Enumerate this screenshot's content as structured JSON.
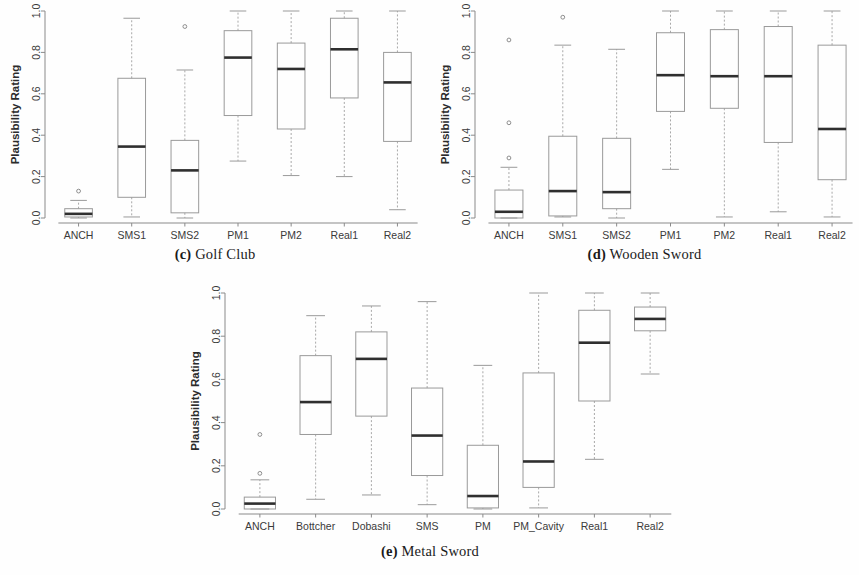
{
  "figure": {
    "y_axis_label": "Plausibility Rating",
    "y_ticks": [
      "0.0",
      "0.2",
      "0.4",
      "0.6",
      "0.8",
      "1.0"
    ]
  },
  "panels": [
    {
      "id": "golf-club",
      "caption_marker": "(c)",
      "caption_text": "Golf Club",
      "caption_full": "(c) Golf Club"
    },
    {
      "id": "wooden-sword",
      "caption_marker": "(d)",
      "caption_text": "Wooden Sword",
      "caption_full": "(d) Wooden Sword"
    },
    {
      "id": "metal-sword",
      "caption_marker": "(e)",
      "caption_text": "Metal Sword",
      "caption_full": "(e) Metal Sword"
    }
  ],
  "chart_data": [
    {
      "type": "box",
      "id": "golf-club",
      "title": "(c) Golf Club",
      "xlabel": "",
      "ylabel": "Plausibility Rating",
      "ylim": [
        0.0,
        1.0
      ],
      "yticks": [
        0.0,
        0.2,
        0.4,
        0.6,
        0.8,
        1.0
      ],
      "grid": false,
      "legend": "none",
      "categories": [
        "ANCH",
        "SMS1",
        "SMS2",
        "PM1",
        "PM2",
        "Real1",
        "Real2"
      ],
      "boxes": [
        {
          "label": "ANCH",
          "whisker_low": 0.0,
          "q1": 0.005,
          "median": 0.02,
          "q3": 0.045,
          "whisker_high": 0.085,
          "outliers": [
            0.13
          ]
        },
        {
          "label": "SMS1",
          "whisker_low": 0.005,
          "q1": 0.1,
          "median": 0.345,
          "q3": 0.675,
          "whisker_high": 0.965,
          "outliers": []
        },
        {
          "label": "SMS2",
          "whisker_low": 0.0,
          "q1": 0.025,
          "median": 0.23,
          "q3": 0.375,
          "whisker_high": 0.715,
          "outliers": [
            0.925
          ]
        },
        {
          "label": "PM1",
          "whisker_low": 0.275,
          "q1": 0.495,
          "median": 0.775,
          "q3": 0.905,
          "whisker_high": 1.0,
          "outliers": []
        },
        {
          "label": "PM2",
          "whisker_low": 0.205,
          "q1": 0.43,
          "median": 0.72,
          "q3": 0.845,
          "whisker_high": 1.0,
          "outliers": []
        },
        {
          "label": "Real1",
          "whisker_low": 0.2,
          "q1": 0.58,
          "median": 0.815,
          "q3": 0.965,
          "whisker_high": 1.0,
          "outliers": []
        },
        {
          "label": "Real2",
          "whisker_low": 0.04,
          "q1": 0.37,
          "median": 0.655,
          "q3": 0.8,
          "whisker_high": 1.0,
          "outliers": []
        }
      ]
    },
    {
      "type": "box",
      "id": "wooden-sword",
      "title": "(d) Wooden Sword",
      "xlabel": "",
      "ylabel": "Plausibility Rating",
      "ylim": [
        0.0,
        1.0
      ],
      "yticks": [
        0.0,
        0.2,
        0.4,
        0.6,
        0.8,
        1.0
      ],
      "grid": false,
      "legend": "none",
      "categories": [
        "ANCH",
        "SMS1",
        "SMS2",
        "PM1",
        "PM2",
        "Real1",
        "Real2"
      ],
      "boxes": [
        {
          "label": "ANCH",
          "whisker_low": 0.0,
          "q1": 0.0,
          "median": 0.03,
          "q3": 0.135,
          "whisker_high": 0.245,
          "outliers": [
            0.29,
            0.46,
            0.86
          ]
        },
        {
          "label": "SMS1",
          "whisker_low": 0.005,
          "q1": 0.01,
          "median": 0.13,
          "q3": 0.395,
          "whisker_high": 0.835,
          "outliers": [
            0.97
          ]
        },
        {
          "label": "SMS2",
          "whisker_low": 0.0,
          "q1": 0.045,
          "median": 0.125,
          "q3": 0.385,
          "whisker_high": 0.815,
          "outliers": []
        },
        {
          "label": "PM1",
          "whisker_low": 0.235,
          "q1": 0.515,
          "median": 0.69,
          "q3": 0.895,
          "whisker_high": 1.0,
          "outliers": []
        },
        {
          "label": "PM2",
          "whisker_low": 0.005,
          "q1": 0.53,
          "median": 0.685,
          "q3": 0.91,
          "whisker_high": 1.0,
          "outliers": []
        },
        {
          "label": "Real1",
          "whisker_low": 0.03,
          "q1": 0.365,
          "median": 0.685,
          "q3": 0.925,
          "whisker_high": 1.0,
          "outliers": []
        },
        {
          "label": "Real2",
          "whisker_low": 0.005,
          "q1": 0.185,
          "median": 0.43,
          "q3": 0.835,
          "whisker_high": 1.0,
          "outliers": []
        }
      ]
    },
    {
      "type": "box",
      "id": "metal-sword",
      "title": "(e) Metal Sword",
      "xlabel": "",
      "ylabel": "Plausibility Rating",
      "ylim": [
        0.0,
        1.0
      ],
      "yticks": [
        0.0,
        0.2,
        0.4,
        0.6,
        0.8,
        1.0
      ],
      "grid": false,
      "legend": "none",
      "categories": [
        "ANCH",
        "Bottcher",
        "Dobashi",
        "SMS",
        "PM",
        "PM_Cavity",
        "Real1",
        "Real2"
      ],
      "boxes": [
        {
          "label": "ANCH",
          "whisker_low": 0.0,
          "q1": 0.0,
          "median": 0.025,
          "q3": 0.055,
          "whisker_high": 0.135,
          "outliers": [
            0.165,
            0.345
          ]
        },
        {
          "label": "Bottcher",
          "whisker_low": 0.045,
          "q1": 0.345,
          "median": 0.495,
          "q3": 0.71,
          "whisker_high": 0.895,
          "outliers": []
        },
        {
          "label": "Dobashi",
          "whisker_low": 0.065,
          "q1": 0.43,
          "median": 0.695,
          "q3": 0.82,
          "whisker_high": 0.94,
          "outliers": []
        },
        {
          "label": "SMS",
          "whisker_low": 0.02,
          "q1": 0.155,
          "median": 0.34,
          "q3": 0.56,
          "whisker_high": 0.96,
          "outliers": []
        },
        {
          "label": "PM",
          "whisker_low": 0.0,
          "q1": 0.005,
          "median": 0.06,
          "q3": 0.295,
          "whisker_high": 0.665,
          "outliers": []
        },
        {
          "label": "PM_Cavity",
          "whisker_low": 0.005,
          "q1": 0.1,
          "median": 0.22,
          "q3": 0.63,
          "whisker_high": 1.0,
          "outliers": []
        },
        {
          "label": "Real1",
          "whisker_low": 0.23,
          "q1": 0.5,
          "median": 0.77,
          "q3": 0.92,
          "whisker_high": 1.0,
          "outliers": []
        },
        {
          "label": "Real2",
          "whisker_low": 0.625,
          "q1": 0.825,
          "median": 0.88,
          "q3": 0.935,
          "whisker_high": 1.0,
          "outliers": []
        }
      ]
    }
  ]
}
